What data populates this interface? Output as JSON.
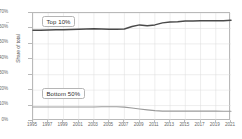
{
  "chart_data": {
    "type": "line",
    "title": "",
    "xlabel": "",
    "ylabel": "Share of total",
    "xlim": [
      1995,
      2021
    ],
    "ylim": [
      0,
      70
    ],
    "grid": true,
    "legend_position": "inline-labels",
    "x": [
      1995,
      1996,
      1997,
      1998,
      1999,
      2000,
      2001,
      2002,
      2003,
      2004,
      2005,
      2006,
      2007,
      2008,
      2009,
      2010,
      2011,
      2012,
      2013,
      2014,
      2015,
      2016,
      2017,
      2018,
      2019,
      2020,
      2021
    ],
    "y_tick_labels": [
      "0%",
      "10%",
      "20%",
      "30%",
      "40%",
      "50%",
      "60%",
      "70%"
    ],
    "y_tick_values": [
      0,
      10,
      20,
      30,
      40,
      50,
      60,
      70
    ],
    "x_tick_labels": [
      "1995",
      "1997",
      "1999",
      "2001",
      "2003",
      "2005",
      "2007",
      "2009",
      "2011",
      "2013",
      "2015",
      "2017",
      "2019",
      "2021"
    ],
    "x_tick_values": [
      1995,
      1997,
      1999,
      2001,
      2003,
      2005,
      2007,
      2009,
      2011,
      2013,
      2015,
      2017,
      2019,
      2021
    ],
    "series": [
      {
        "name": "Top 10%",
        "color": "#4a4a4a",
        "label_text": "Top 10%",
        "values": [
          58.8,
          58.9,
          59.0,
          59.1,
          59.2,
          59.3,
          59.4,
          59.6,
          59.8,
          59.6,
          59.5,
          59.4,
          59.6,
          61.2,
          62.3,
          61.8,
          62.3,
          63.6,
          64.2,
          64.4,
          64.8,
          64.8,
          64.9,
          64.9,
          64.9,
          65.0,
          65.3
        ]
      },
      {
        "name": "Bottom 50%",
        "color": "#9a9a9a",
        "label_text": "Bottom 50%",
        "values": [
          9.1,
          9.1,
          9.1,
          9.1,
          9.1,
          9.1,
          9.1,
          9.1,
          9.1,
          9.2,
          9.2,
          9.2,
          9.0,
          8.4,
          7.8,
          7.2,
          6.7,
          6.4,
          6.4,
          6.4,
          6.4,
          6.4,
          6.4,
          6.4,
          6.4,
          6.3,
          6.3
        ]
      }
    ]
  },
  "axis": {
    "y_title": "Share of total"
  }
}
